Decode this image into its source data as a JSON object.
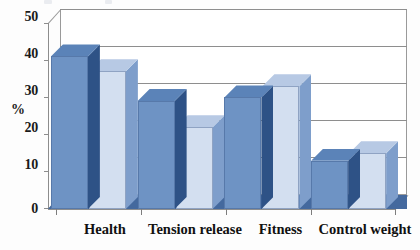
{
  "chart_data": {
    "type": "bar",
    "title": "",
    "subtitle": "",
    "xlabel": "",
    "ylabel": "%",
    "ylim": [
      0,
      50
    ],
    "yticks": [
      0,
      10,
      20,
      30,
      40,
      50
    ],
    "grid": true,
    "legend": "none",
    "style": "3d-clustered-column",
    "categories": [
      "Health",
      "Tension release",
      "Fitness",
      "Control weight"
    ],
    "series": [
      {
        "name": "Series 1",
        "color": "#6e93c4",
        "values": [
          41,
          29,
          30,
          13
        ]
      },
      {
        "name": "Series 2",
        "color": "#d3dff0",
        "values": [
          37,
          22,
          33,
          15
        ]
      }
    ]
  },
  "axis": {
    "y_tick_labels": [
      "50",
      "40",
      "30",
      "20",
      "10",
      "0"
    ],
    "y_axis_title": "%"
  },
  "colors": {
    "series1_front": "#6e93c4",
    "series1_side": "#2e5286",
    "series1_top": "#5b83b8",
    "series2_front": "#d3dff0",
    "series2_side": "#7e9ecb",
    "series2_top": "#b7c9e4",
    "floor": "#44699e",
    "gridline": "#8e8e8e",
    "frame": "#9a9a9a",
    "text": "#111111",
    "background": "#fdfdfd"
  }
}
